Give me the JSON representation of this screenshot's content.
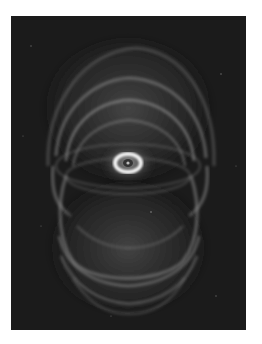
{
  "image": {
    "subject": "planetary nebula",
    "description": "Grayscale astronomical photograph of an hourglass-shaped planetary nebula with nested elliptical shells and a bright central ring on a dark starfield",
    "colors": {
      "background": "#ffffff",
      "sky": "#1a1a1a",
      "shells": "#9a9a9a",
      "core_ring": "#f4f4f4"
    }
  }
}
